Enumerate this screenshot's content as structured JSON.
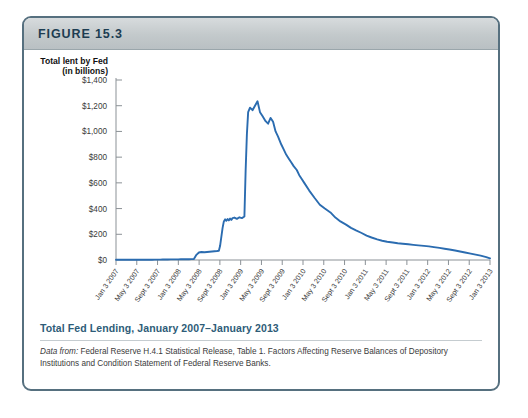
{
  "figure": {
    "label": "FIGURE 15.3",
    "caption": "Total Fed Lending, January 2007–January 2013",
    "source_prefix": "Data from:",
    "source_text": " Federal Reserve H.4.1 Statistical Release, Table 1. Factors Affecting Reserve Balances of Depository Institutions and Condition Statement of Federal Reserve Banks."
  },
  "colors": {
    "series": "#2b6cb0",
    "border": "#56707f",
    "header_gradient_top": "#d7dbdd",
    "header_gradient_bottom": "#b9c0c3",
    "caption": "#2e5c78",
    "axis": "#8b9196"
  },
  "chart_data": {
    "type": "line",
    "title": "Total Fed Lending, January 2007–January 2013",
    "xlabel": "",
    "ylabel": "Total lent by Fed (in billions)",
    "ylabel_line1": "Total lent by Fed",
    "ylabel_line2": "(in billions)",
    "ylim": [
      0,
      1400
    ],
    "ytick_values": [
      0,
      200,
      400,
      600,
      800,
      1000,
      1200,
      1400
    ],
    "ytick_labels": [
      "$0",
      "$200",
      "$400",
      "$600",
      "$800",
      "$1,000",
      "$1,200",
      "$1,400"
    ],
    "grid": false,
    "legend": "none",
    "xlim": [
      "2007-01-03",
      "2013-01-03"
    ],
    "xtick_labels": [
      "Jan 3 2007",
      "May 3 2007",
      "Sept 3 2007",
      "Jan 3 2008",
      "May 3 2008",
      "Sept 3 2008",
      "Jan 3 2009",
      "May 3 2009",
      "Sept 3 2009",
      "Jan 3 2010",
      "May 3 2010",
      "Sept 3 2010",
      "Jan 3 2011",
      "May 3 2011",
      "Sept 3 2011",
      "Jan 3 2012",
      "May 3 2012",
      "Sept 3 2012",
      "Jan 3 2013"
    ],
    "series": [
      {
        "name": "Total lent by Fed",
        "units": "billions of dollars",
        "x": [
          0.0,
          0.08,
          0.17,
          0.25,
          0.33,
          0.42,
          0.5,
          0.58,
          0.62,
          0.67,
          0.71,
          0.75,
          0.79,
          0.83,
          0.88,
          0.92,
          0.96,
          1.0,
          1.04,
          1.08,
          1.12,
          1.17,
          1.21,
          1.25,
          1.29,
          1.33,
          1.37,
          1.42,
          1.46,
          1.5,
          1.54,
          1.58,
          1.62,
          1.65,
          1.67,
          1.69,
          1.71,
          1.73,
          1.75,
          1.77,
          1.79,
          1.81,
          1.83,
          1.85,
          1.87,
          1.9,
          1.94,
          1.98,
          2.02,
          2.06,
          2.08,
          2.1,
          2.12,
          2.15,
          2.19,
          2.23,
          2.27,
          2.31,
          2.35,
          2.4,
          2.44,
          2.48,
          2.52,
          2.56,
          2.6,
          2.65,
          2.69,
          2.73,
          2.77,
          2.81,
          2.85,
          2.9,
          2.94,
          2.98,
          3.02,
          3.1,
          3.19,
          3.27,
          3.35,
          3.44,
          3.52,
          3.6,
          3.69,
          3.77,
          3.85,
          3.94,
          4.02,
          4.1,
          4.19,
          4.27,
          4.35,
          4.44,
          4.52,
          4.6,
          4.69,
          4.77,
          4.85,
          4.94,
          5.02,
          5.1,
          5.19,
          5.27,
          5.35,
          5.44,
          5.52,
          5.6,
          5.69,
          5.77,
          5.85,
          5.94,
          6.0
        ],
        "y": [
          2,
          2,
          2,
          2,
          2,
          2,
          2,
          2,
          3,
          3,
          3,
          4,
          4,
          4,
          5,
          5,
          5,
          5,
          6,
          6,
          6,
          6,
          7,
          8,
          40,
          58,
          62,
          60,
          62,
          64,
          66,
          68,
          70,
          72,
          110,
          180,
          250,
          300,
          316,
          305,
          318,
          308,
          322,
          312,
          326,
          330,
          320,
          332,
          326,
          338,
          700,
          980,
          1150,
          1185,
          1165,
          1200,
          1235,
          1150,
          1120,
          1080,
          1060,
          1105,
          1075,
          1000,
          960,
          900,
          860,
          820,
          790,
          760,
          730,
          700,
          660,
          630,
          600,
          540,
          480,
          430,
          400,
          370,
          330,
          300,
          275,
          250,
          230,
          210,
          190,
          175,
          160,
          150,
          142,
          136,
          130,
          126,
          122,
          118,
          114,
          110,
          106,
          100,
          94,
          88,
          82,
          74,
          66,
          58,
          50,
          42,
          34,
          22,
          12
        ]
      }
    ],
    "annotations": [
      {
        "text": "Near zero lending through most of 2007",
        "period": "2007"
      },
      {
        "text": "First rise begins around March 2008 (Bear Stearns)",
        "period": "2008-03"
      },
      {
        "text": "Plateau near $320 billion mid-2008",
        "period": "2008-mid"
      },
      {
        "text": "Peak approximately $1,235 billion in late 2008",
        "period": "2008-12"
      },
      {
        "text": "Steady decline back toward zero by January 2013",
        "period": "2009-2013"
      }
    ]
  }
}
